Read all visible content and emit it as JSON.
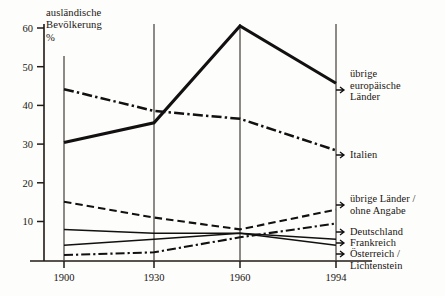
{
  "chart_data": {
    "type": "line",
    "title": "ausländische\nBevölkerung\n%",
    "xlabel": "",
    "ylabel": "%",
    "x": [
      "1900",
      "1930",
      "1960",
      "1994"
    ],
    "xlim": [
      1900,
      1994
    ],
    "ylim": [
      0,
      62
    ],
    "yticks": [
      10,
      20,
      30,
      40,
      50,
      60
    ],
    "grid": "vertical gridlines at each x category",
    "legend_position": "right, labels attached to series end points with arrows",
    "series": [
      {
        "name": "übrige europäische Länder",
        "style": "thick-solid",
        "values": [
          30,
          35,
          59.5,
          45
        ]
      },
      {
        "name": "Italien",
        "style": "dash-dot",
        "values": [
          43.5,
          38,
          36,
          28
        ]
      },
      {
        "name": "übrige Länder / ohne Angabe",
        "style": "dashed",
        "values": [
          15,
          11,
          8,
          13
        ]
      },
      {
        "name": "Deutschland",
        "style": "thin-solid",
        "values": [
          8,
          7,
          7,
          5.5
        ]
      },
      {
        "name": "Frankreich",
        "style": "thin-solid-2",
        "values": [
          4,
          5.5,
          7,
          4
        ]
      },
      {
        "name": "Österreich / Lichtenstein",
        "style": "dash-dot-thin",
        "values": [
          1.5,
          2.2,
          6,
          9.5
        ]
      }
    ]
  },
  "axis": {
    "ytick_labels": [
      "60",
      "50",
      "40",
      "30",
      "20",
      "10"
    ],
    "xtick_labels": [
      "1900",
      "1930",
      "1960",
      "1994"
    ]
  },
  "legend": {
    "items": [
      {
        "label": "übrige\neuropäische\nLänder"
      },
      {
        "label": "Italien"
      },
      {
        "label": "übrige Länder /\nohne Angabe"
      },
      {
        "label": "Deutschland"
      },
      {
        "label": "Frankreich"
      },
      {
        "label": "Österreich /\nLichtenstein"
      }
    ]
  }
}
